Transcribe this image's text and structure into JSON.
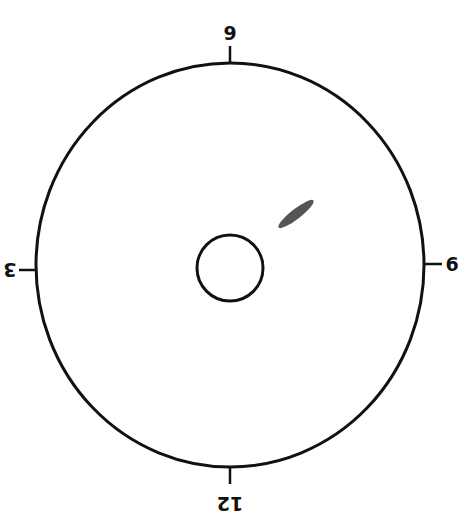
{
  "diagram": {
    "type": "clock-face-dial",
    "outer_circle": {
      "cx": 230,
      "cy": 265,
      "rx": 194,
      "ry": 202
    },
    "inner_circle": {
      "cx": 230,
      "cy": 268,
      "r": 33
    },
    "labels": {
      "top": "9",
      "bottom": "12",
      "left": "3",
      "right": "6"
    },
    "marker": {
      "description": "elongated dark spot",
      "cx": 296,
      "cy": 214,
      "rx": 22,
      "ry": 5,
      "angle": -38
    },
    "colors": {
      "stroke": "#111111",
      "marker": "#555555",
      "background": "#ffffff"
    }
  }
}
